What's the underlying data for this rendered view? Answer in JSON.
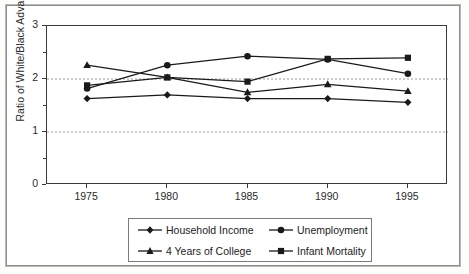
{
  "chart_data": {
    "type": "line",
    "title": "",
    "xlabel": "",
    "ylabel": "Ratio of White/Black Advantage",
    "x": [
      1975,
      1980,
      1985,
      1990,
      1995
    ],
    "categories": [
      "1975",
      "1980",
      "1985",
      "1990",
      "1995"
    ],
    "xtick_labels": [
      "1975",
      "1980",
      "1985",
      "1990",
      "1995"
    ],
    "ytick_labels": [
      "0",
      "1",
      "2",
      "3"
    ],
    "ytick_values": [
      0,
      1,
      2,
      3
    ],
    "ylim": [
      0,
      3
    ],
    "xlim": [
      1972.5,
      1997.5
    ],
    "grid": "horizontal dashed gridlines at y=1 and y=2",
    "legend_position": "below plot, centered, 2 columns x 2 rows",
    "series": [
      {
        "name": "Household Income",
        "marker": "diamond",
        "color": "#1a1a1a",
        "values": [
          1.63,
          1.7,
          1.63,
          1.63,
          1.56
        ]
      },
      {
        "name": "Unemployment",
        "marker": "circle",
        "color": "#1a1a1a",
        "values": [
          1.82,
          2.26,
          2.43,
          2.37,
          2.1
        ]
      },
      {
        "name": "4 Years of College",
        "marker": "triangle",
        "color": "#1a1a1a",
        "values": [
          2.26,
          2.03,
          1.75,
          1.9,
          1.77
        ]
      },
      {
        "name": "Infant Mortality",
        "marker": "square",
        "color": "#1a1a1a",
        "values": [
          1.88,
          2.03,
          1.95,
          2.38,
          2.4
        ]
      }
    ]
  },
  "axes": {
    "y_label": "Ratio of White/Black Advantage",
    "y_ticks": [
      "3",
      "2",
      "1",
      "0"
    ],
    "x_ticks": [
      "1975",
      "1980",
      "1985",
      "1990",
      "1995"
    ]
  },
  "legend": {
    "entries": [
      {
        "label": "Household Income",
        "marker": "diamond"
      },
      {
        "label": "Unemployment",
        "marker": "circle"
      },
      {
        "label": "4 Years of College",
        "marker": "triangle"
      },
      {
        "label": "Infant Mortality",
        "marker": "square"
      }
    ]
  },
  "colors": {
    "line": "#1a1a1a",
    "axis": "#3a3a3a",
    "gridline": "#9a9a9a",
    "frame": "#8e8e8e",
    "background": "#ffffff"
  }
}
